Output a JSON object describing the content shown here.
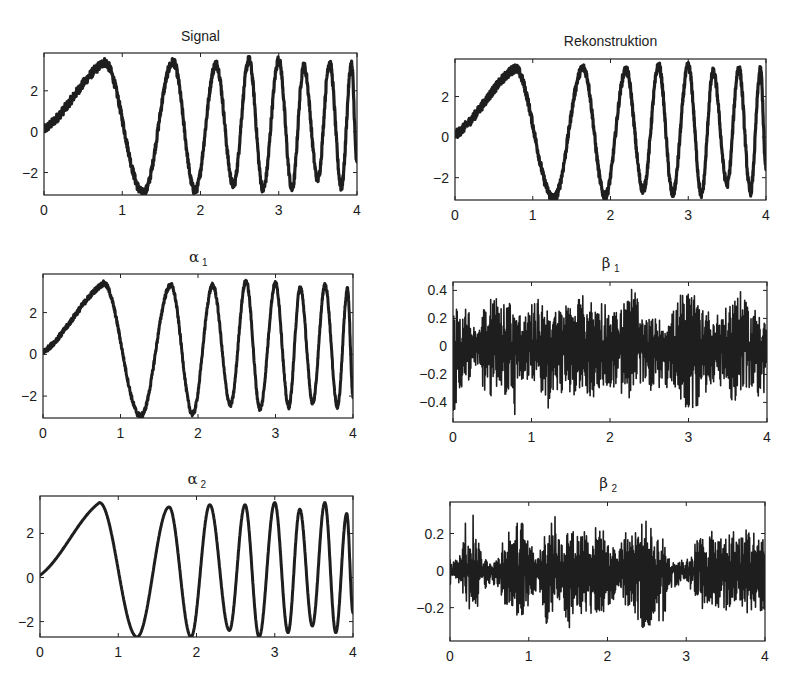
{
  "figure": {
    "layout": "3x2 grid of subplots"
  },
  "chart_data": [
    {
      "id": "signal",
      "type": "line",
      "title": "Signal",
      "title_kind": "text",
      "xlabel": "",
      "ylabel": "",
      "xlim": [
        0,
        4
      ],
      "ylim": [
        -3.1,
        3.85
      ],
      "xticks": [
        0,
        1,
        2,
        3,
        4
      ],
      "xtick_labels": [
        "0",
        "1",
        "2",
        "3",
        "4"
      ],
      "yticks": [
        -2,
        0,
        2
      ],
      "ytick_labels": [
        "−2",
        "0",
        "2"
      ],
      "grid": false,
      "model": "chirp",
      "noise": 0.22,
      "extrema": [
        [
          0,
          0.1
        ],
        [
          0.77,
          3.4
        ],
        [
          1.27,
          -3.0
        ],
        [
          1.65,
          3.4
        ],
        [
          1.93,
          -2.9
        ],
        [
          2.2,
          3.3
        ],
        [
          2.42,
          -2.6
        ],
        [
          2.62,
          3.5
        ],
        [
          2.8,
          -2.8
        ],
        [
          3.0,
          3.5
        ],
        [
          3.17,
          -2.8
        ],
        [
          3.32,
          3.2
        ],
        [
          3.5,
          -2.3
        ],
        [
          3.65,
          3.4
        ],
        [
          3.8,
          -2.7
        ],
        [
          3.93,
          3.3
        ],
        [
          4.0,
          -1.6
        ]
      ]
    },
    {
      "id": "rekonstruktion",
      "type": "line",
      "title": "Rekonstruktion",
      "title_kind": "text",
      "xlabel": "",
      "ylabel": "",
      "xlim": [
        0,
        4
      ],
      "ylim": [
        -3.1,
        3.85
      ],
      "xticks": [
        0,
        1,
        2,
        3,
        4
      ],
      "xtick_labels": [
        "0",
        "1",
        "2",
        "3",
        "4"
      ],
      "yticks": [
        -2,
        0,
        2
      ],
      "ytick_labels": [
        "−2",
        "0",
        "2"
      ],
      "grid": false,
      "model": "chirp",
      "noise": 0.22,
      "extrema": [
        [
          0,
          0.1
        ],
        [
          0.77,
          3.4
        ],
        [
          1.27,
          -3.0
        ],
        [
          1.65,
          3.4
        ],
        [
          1.93,
          -2.9
        ],
        [
          2.2,
          3.3
        ],
        [
          2.42,
          -2.6
        ],
        [
          2.62,
          3.5
        ],
        [
          2.8,
          -2.8
        ],
        [
          3.0,
          3.5
        ],
        [
          3.17,
          -2.8
        ],
        [
          3.32,
          3.2
        ],
        [
          3.5,
          -2.3
        ],
        [
          3.65,
          3.4
        ],
        [
          3.8,
          -2.7
        ],
        [
          3.93,
          3.3
        ],
        [
          4.0,
          -1.6
        ]
      ]
    },
    {
      "id": "alpha1",
      "type": "line",
      "title": "α",
      "title_subscript": "1",
      "title_kind": "greek",
      "xlabel": "",
      "ylabel": "",
      "xlim": [
        0,
        4
      ],
      "ylim": [
        -3.05,
        3.85
      ],
      "xticks": [
        0,
        1,
        2,
        3,
        4
      ],
      "xtick_labels": [
        "0",
        "1",
        "2",
        "3",
        "4"
      ],
      "yticks": [
        -2,
        0,
        2
      ],
      "ytick_labels": [
        "−2",
        "0",
        "2"
      ],
      "grid": false,
      "model": "chirp",
      "noise": 0.12,
      "extrema": [
        [
          0,
          0.1
        ],
        [
          0.78,
          3.4
        ],
        [
          1.26,
          -2.95
        ],
        [
          1.65,
          3.3
        ],
        [
          1.93,
          -2.85
        ],
        [
          2.19,
          3.3
        ],
        [
          2.42,
          -2.4
        ],
        [
          2.62,
          3.5
        ],
        [
          2.8,
          -2.6
        ],
        [
          3.0,
          3.4
        ],
        [
          3.17,
          -2.5
        ],
        [
          3.32,
          3.2
        ],
        [
          3.48,
          -2.3
        ],
        [
          3.64,
          3.3
        ],
        [
          3.8,
          -2.5
        ],
        [
          3.93,
          3.1
        ],
        [
          4.0,
          -2.0
        ]
      ]
    },
    {
      "id": "beta1",
      "type": "line",
      "title": "β",
      "title_subscript": "1",
      "title_kind": "greek",
      "xlabel": "",
      "ylabel": "",
      "xlim": [
        0,
        4
      ],
      "ylim": [
        -0.54,
        0.46
      ],
      "xticks": [
        0,
        1,
        2,
        3,
        4
      ],
      "xtick_labels": [
        "0",
        "1",
        "2",
        "3",
        "4"
      ],
      "yticks": [
        -0.4,
        -0.2,
        0,
        0.2,
        0.4
      ],
      "ytick_labels": [
        "−0.4",
        "−0.2",
        "0",
        "0.2",
        "0.4"
      ],
      "grid": false,
      "model": "noise",
      "envelope": [
        [
          0.0,
          0.4,
          -0.52
        ],
        [
          0.1,
          0.3,
          -0.3
        ],
        [
          0.2,
          0.25,
          -0.25
        ],
        [
          0.3,
          0.1,
          -0.12
        ],
        [
          0.4,
          0.38,
          -0.35
        ],
        [
          0.5,
          0.42,
          -0.42
        ],
        [
          0.6,
          0.3,
          -0.32
        ],
        [
          0.7,
          0.35,
          -0.38
        ],
        [
          0.8,
          0.3,
          -0.52
        ],
        [
          0.9,
          0.2,
          -0.3
        ],
        [
          1.0,
          0.3,
          -0.25
        ],
        [
          1.1,
          0.35,
          -0.3
        ],
        [
          1.2,
          0.3,
          -0.48
        ],
        [
          1.3,
          0.25,
          -0.3
        ],
        [
          1.4,
          0.3,
          -0.35
        ],
        [
          1.5,
          0.32,
          -0.38
        ],
        [
          1.6,
          0.35,
          -0.3
        ],
        [
          1.7,
          0.38,
          -0.35
        ],
        [
          1.8,
          0.3,
          -0.4
        ],
        [
          1.9,
          0.35,
          -0.3
        ],
        [
          2.0,
          0.28,
          -0.3
        ],
        [
          2.1,
          0.25,
          -0.3
        ],
        [
          2.2,
          0.35,
          -0.42
        ],
        [
          2.3,
          0.46,
          -0.38
        ],
        [
          2.4,
          0.2,
          -0.28
        ],
        [
          2.5,
          0.2,
          -0.32
        ],
        [
          2.6,
          0.2,
          -0.3
        ],
        [
          2.7,
          0.18,
          -0.3
        ],
        [
          2.8,
          0.25,
          -0.3
        ],
        [
          2.9,
          0.38,
          -0.4
        ],
        [
          3.0,
          0.4,
          -0.47
        ],
        [
          3.1,
          0.35,
          -0.45
        ],
        [
          3.2,
          0.32,
          -0.35
        ],
        [
          3.3,
          0.2,
          -0.3
        ],
        [
          3.4,
          0.25,
          -0.28
        ],
        [
          3.5,
          0.28,
          -0.35
        ],
        [
          3.6,
          0.46,
          -0.44
        ],
        [
          3.7,
          0.35,
          -0.3
        ],
        [
          3.8,
          0.25,
          -0.35
        ],
        [
          3.9,
          0.3,
          -0.38
        ],
        [
          4.0,
          0.2,
          -0.3
        ]
      ]
    },
    {
      "id": "alpha2",
      "type": "line",
      "title": "α",
      "title_subscript": "2",
      "title_kind": "greek",
      "xlabel": "",
      "ylabel": "",
      "xlim": [
        0,
        4
      ],
      "ylim": [
        -2.7,
        3.7
      ],
      "xticks": [
        0,
        1,
        2,
        3,
        4
      ],
      "xtick_labels": [
        "0",
        "1",
        "2",
        "3",
        "4"
      ],
      "yticks": [
        -2,
        0,
        2
      ],
      "ytick_labels": [
        "−2",
        "0",
        "2"
      ],
      "grid": false,
      "model": "chirp",
      "noise": 0.0,
      "extrema": [
        [
          0,
          0.1
        ],
        [
          0.76,
          3.4
        ],
        [
          1.24,
          -2.7
        ],
        [
          1.65,
          3.2
        ],
        [
          1.93,
          -2.7
        ],
        [
          2.17,
          3.3
        ],
        [
          2.42,
          -2.4
        ],
        [
          2.62,
          3.3
        ],
        [
          2.8,
          -2.7
        ],
        [
          3.0,
          3.4
        ],
        [
          3.17,
          -2.5
        ],
        [
          3.32,
          3.1
        ],
        [
          3.48,
          -2.2
        ],
        [
          3.64,
          3.4
        ],
        [
          3.78,
          -2.5
        ],
        [
          3.92,
          2.9
        ],
        [
          4.0,
          -1.6
        ]
      ]
    },
    {
      "id": "beta2",
      "type": "line",
      "title": "β",
      "title_subscript": "2",
      "title_kind": "greek",
      "xlabel": "",
      "ylabel": "",
      "xlim": [
        0,
        4
      ],
      "ylim": [
        -0.38,
        0.37
      ],
      "xticks": [
        0,
        1,
        2,
        3,
        4
      ],
      "xtick_labels": [
        "0",
        "1",
        "2",
        "3",
        "4"
      ],
      "yticks": [
        -0.2,
        0,
        0.2
      ],
      "ytick_labels": [
        "−0.2",
        "0",
        "0.2"
      ],
      "grid": false,
      "model": "noise",
      "envelope": [
        [
          0.0,
          0.1,
          -0.08
        ],
        [
          0.1,
          0.05,
          -0.05
        ],
        [
          0.2,
          0.28,
          -0.25
        ],
        [
          0.3,
          0.33,
          -0.32
        ],
        [
          0.4,
          0.08,
          -0.1
        ],
        [
          0.5,
          0.06,
          -0.1
        ],
        [
          0.6,
          0.06,
          -0.08
        ],
        [
          0.7,
          0.24,
          -0.2
        ],
        [
          0.8,
          0.22,
          -0.2
        ],
        [
          0.9,
          0.3,
          -0.3
        ],
        [
          1.0,
          0.15,
          -0.2
        ],
        [
          1.1,
          0.1,
          -0.12
        ],
        [
          1.2,
          0.2,
          -0.22
        ],
        [
          1.25,
          0.37,
          -0.38
        ],
        [
          1.3,
          0.37,
          -0.3
        ],
        [
          1.4,
          0.15,
          -0.2
        ],
        [
          1.5,
          0.25,
          -0.32
        ],
        [
          1.6,
          0.2,
          -0.25
        ],
        [
          1.7,
          0.25,
          -0.28
        ],
        [
          1.8,
          0.2,
          -0.25
        ],
        [
          1.9,
          0.28,
          -0.25
        ],
        [
          2.0,
          0.15,
          -0.2
        ],
        [
          2.1,
          0.12,
          -0.15
        ],
        [
          2.2,
          0.2,
          -0.2
        ],
        [
          2.3,
          0.22,
          -0.2
        ],
        [
          2.4,
          0.25,
          -0.3
        ],
        [
          2.5,
          0.27,
          -0.33
        ],
        [
          2.6,
          0.2,
          -0.25
        ],
        [
          2.7,
          0.18,
          -0.3
        ],
        [
          2.8,
          0.06,
          -0.1
        ],
        [
          2.9,
          0.06,
          -0.08
        ],
        [
          3.0,
          0.05,
          -0.06
        ],
        [
          3.1,
          0.15,
          -0.15
        ],
        [
          3.2,
          0.2,
          -0.22
        ],
        [
          3.3,
          0.22,
          -0.2
        ],
        [
          3.4,
          0.18,
          -0.2
        ],
        [
          3.5,
          0.2,
          -0.22
        ],
        [
          3.6,
          0.22,
          -0.2
        ],
        [
          3.7,
          0.2,
          -0.2
        ],
        [
          3.8,
          0.25,
          -0.25
        ],
        [
          3.9,
          0.2,
          -0.2
        ],
        [
          4.0,
          0.2,
          -0.38
        ]
      ]
    }
  ]
}
